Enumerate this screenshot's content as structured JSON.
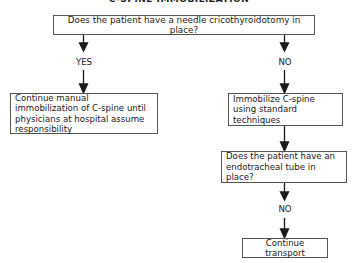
{
  "title": "C-SPINE IMMOBILIZATION",
  "nodes": {
    "q1": "Does the patient have a needle cricothyroidotomy in place?",
    "yes_action": "Continue manual immobilization of C-spine until physicians at hospital assume responsibility",
    "no_action": "Immobilize C-spine using standard techniques",
    "q2": "Does the patient have an endotracheal tube in place?",
    "final": "Continue transport"
  },
  "labels": {
    "yes": "YES",
    "no1": "NO",
    "no2": "NO"
  }
}
